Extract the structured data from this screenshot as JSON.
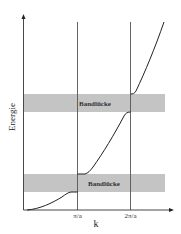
{
  "diagram": {
    "title": "",
    "y_axis_label": "Energie",
    "x_axis_label": "k",
    "x_ticks": [
      "π/a",
      "2π/a"
    ],
    "bands": [
      {
        "label": "Bandlücke",
        "position": "upper"
      },
      {
        "label": "Bandlücke",
        "position": "lower"
      }
    ],
    "colors": {
      "band_gap": "#c4c4c4",
      "lines": "#333333",
      "background": "#ffffff"
    }
  }
}
